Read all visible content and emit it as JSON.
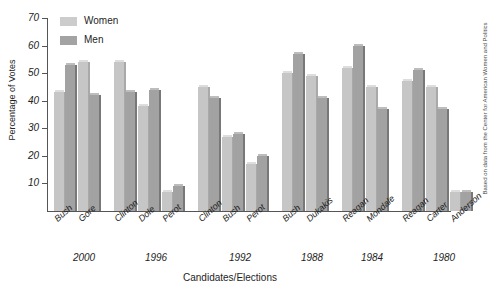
{
  "chart_data": {
    "type": "bar",
    "title": "",
    "xlabel": "Candidates/Elections",
    "ylabel": "Percentage of Votes",
    "ylim": [
      0,
      70
    ],
    "ytick_values": [
      70,
      60,
      50,
      40,
      30,
      20,
      10
    ],
    "grid": false,
    "legend_position": "top-left",
    "series": [
      {
        "name": "Women",
        "color": "#c6c6c6",
        "values": [
          43,
          54,
          54,
          38,
          7,
          45,
          27,
          17,
          50,
          49,
          52,
          45,
          47,
          45,
          7
        ]
      },
      {
        "name": "Men",
        "color": "#a2a2a2",
        "values": [
          53,
          42,
          43,
          44,
          9,
          41,
          28,
          20,
          57,
          41,
          60,
          37,
          51,
          37,
          7
        ]
      }
    ],
    "categories": [
      "Bush",
      "Gore",
      "Clinton",
      "Dole",
      "Perot",
      "Clinton",
      "Bush",
      "Perot",
      "Bush",
      "Dukakis",
      "Reagan",
      "Mondale",
      "Reagan",
      "Carter",
      "Anderson"
    ],
    "groups": [
      {
        "year": "2000",
        "candidates": [
          "Bush",
          "Gore"
        ]
      },
      {
        "year": "1996",
        "candidates": [
          "Clinton",
          "Dole",
          "Perot"
        ]
      },
      {
        "year": "1992",
        "candidates": [
          "Clinton",
          "Bush",
          "Perot"
        ]
      },
      {
        "year": "1988",
        "candidates": [
          "Bush",
          "Dukakis"
        ]
      },
      {
        "year": "1984",
        "candidates": [
          "Reagan",
          "Mondale"
        ]
      },
      {
        "year": "1980",
        "candidates": [
          "Reagan",
          "Carter",
          "Anderson"
        ]
      }
    ],
    "annotations": [
      "Based on data from the Center for American Women and Politics"
    ]
  },
  "legend": {
    "items": [
      {
        "label": "Women",
        "swatch": "women"
      },
      {
        "label": "Men",
        "swatch": "men"
      }
    ]
  },
  "axes": {
    "y_title": "Percentage of Votes",
    "x_title": "Candidates/Elections",
    "y_ticks": [
      "70",
      "60",
      "50",
      "40",
      "30",
      "20",
      "10"
    ]
  },
  "source_note": "Based on data from the Center for American Women and Politics"
}
